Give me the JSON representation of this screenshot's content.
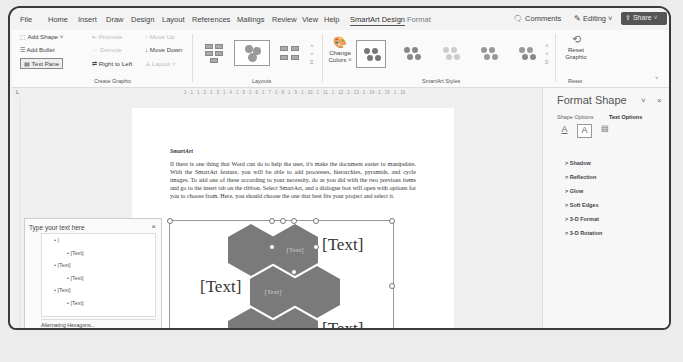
{
  "menu": {
    "tabs": [
      "File",
      "Home",
      "Insert",
      "Draw",
      "Design",
      "Layout",
      "References",
      "Mailings",
      "Review",
      "View",
      "Help",
      "SmartArt Design",
      "Format"
    ],
    "active_tab": "SmartArt Design",
    "comments": "Comments",
    "editing": "Editing",
    "share": "Share"
  },
  "ribbon": {
    "create_graphic": {
      "add_shape": "Add Shape",
      "add_bullet": "Add Bullet",
      "text_pane": "Text Pane",
      "promote": "Promote",
      "demote": "Demote",
      "right_to_left": "Right to Left",
      "move_up": "Move Up",
      "move_down": "Move Down",
      "layout": "Layout",
      "group_label": "Create Graphic"
    },
    "layouts": {
      "group_label": "Layouts"
    },
    "change_colors": [
      "Change",
      "Colors"
    ],
    "smartart_styles": {
      "group_label": "SmartArt Styles"
    },
    "reset": {
      "button": [
        "Reset",
        "Graphic"
      ],
      "group_label": "Reset"
    }
  },
  "ruler": {
    "ticks": "1 · 1 · 1 · 2 · 1 · 3 · 1 · 4 · 1 · 5 · 1 · 6 · 1 · 7 · 1 · 8 · 1 · 9 · 1 · 10 · 1 · 11 · 1 · 12 · 1 · 13 · 1 · 14 · 1 · 15 · 1 · 16"
  },
  "document": {
    "heading": "SmartArt",
    "paragraph": "If there is one thing that Word can do to help the user, it's make the document easier to manipulate. With the SmartArt feature, you will be able to add processes, hierarchies, pyramids, and cycle images. To add one of these according to your necessity, do as you did with the two previous items and go to the insert tab on the ribbon. Select SmartArt, and a dialogue box will open with options for you to choose from. Here, you should choose the one that best fits your project and select it."
  },
  "smartart": {
    "hex_label": "[Text]",
    "outer_labels": [
      "[Text]",
      "[Text]",
      "[Text]"
    ]
  },
  "text_pane": {
    "title": "Type your text here",
    "close": "×",
    "items": [
      {
        "level": 1,
        "text": "|"
      },
      {
        "level": 2,
        "text": "[Text]"
      },
      {
        "level": 1,
        "text": "[Text]"
      },
      {
        "level": 2,
        "text": "[Text]"
      },
      {
        "level": 1,
        "text": "[Text]"
      },
      {
        "level": 2,
        "text": "[Text]"
      }
    ],
    "footer": "Alternating Hexagons..."
  },
  "format_pane": {
    "title": "Format Shape",
    "tabs": [
      "Shape Options",
      "Text Options"
    ],
    "active_tab": "Text Options",
    "sections": [
      "Shadow",
      "Reflection",
      "Glow",
      "Soft Edges",
      "3-D Format",
      "3-D Rotation"
    ]
  },
  "colors": {
    "hex_fill": "#7a7a7a",
    "share_bg": "#555555",
    "frame": "#3a3a3a"
  }
}
